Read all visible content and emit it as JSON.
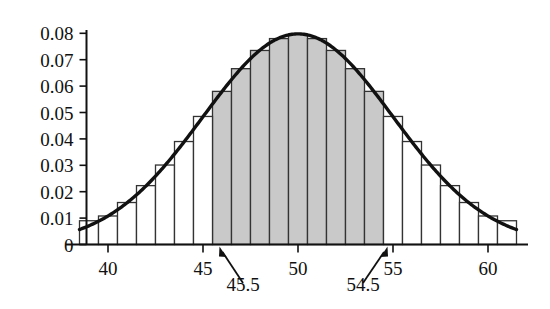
{
  "chart_data": {
    "type": "bar",
    "title": "",
    "subtitle": "",
    "xlabel": "",
    "ylabel": "",
    "grid": false,
    "legend": null,
    "xlim": [
      38.5,
      61.5
    ],
    "ylim": [
      0,
      0.085
    ],
    "xticks": [
      40,
      45,
      50,
      55,
      60
    ],
    "xtick_labels": [
      "40",
      "45",
      "50",
      "55",
      "60"
    ],
    "yticks": [
      0,
      0.01,
      0.02,
      0.03,
      0.04,
      0.05,
      0.06,
      0.07,
      0.08
    ],
    "ytick_labels": [
      "0",
      "0.01",
      "0.02",
      "0.03",
      "0.04",
      "0.05",
      "0.06",
      "0.07",
      "0.08"
    ],
    "bar_width": 1,
    "categories": [
      39,
      40,
      41,
      42,
      43,
      44,
      45,
      46,
      47,
      48,
      49,
      50,
      51,
      52,
      53,
      54,
      55,
      56,
      57,
      58,
      59,
      60,
      61
    ],
    "values": [
      0.009,
      0.0108,
      0.0159,
      0.0223,
      0.0301,
      0.039,
      0.0485,
      0.058,
      0.0666,
      0.0735,
      0.078,
      0.0796,
      0.078,
      0.0735,
      0.0666,
      0.058,
      0.0485,
      0.039,
      0.0301,
      0.0223,
      0.0159,
      0.0108,
      0.009
    ],
    "bars_style": {
      "fill": "#ffffff",
      "edge": "#333333",
      "shaded_fill": "#c9c9c9"
    },
    "shaded_region": {
      "from": 45.5,
      "to": 54.5,
      "color": "#c9c9c9"
    },
    "curve": {
      "name": "normal approximation",
      "mean": 50,
      "sd": 5,
      "peak": 0.0798,
      "color": "#111111",
      "linewidth": 3
    },
    "annotations": [
      {
        "label": "45.5",
        "points_to_x": 45.5,
        "points_to_y": 0
      },
      {
        "label": "54.5",
        "points_to_x": 54.5,
        "points_to_y": 0
      }
    ]
  }
}
